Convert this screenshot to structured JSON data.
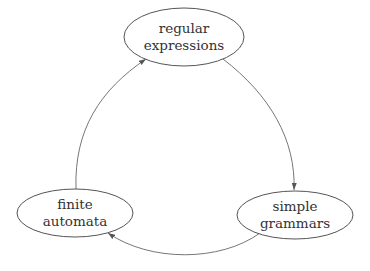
{
  "diagram": {
    "type": "cycle",
    "nodes": [
      {
        "id": "regex",
        "line1": "regular",
        "line2": "expressions",
        "cx": 184,
        "cy": 37,
        "rx": 60,
        "ry": 29
      },
      {
        "id": "grammars",
        "line1": "simple",
        "line2": "grammars",
        "cx": 295,
        "cy": 215,
        "rx": 58,
        "ry": 24
      },
      {
        "id": "automata",
        "line1": "finite",
        "line2": "automata",
        "cx": 75,
        "cy": 213,
        "rx": 58,
        "ry": 24
      }
    ],
    "edges": [
      {
        "from": "regex",
        "to": "grammars"
      },
      {
        "from": "grammars",
        "to": "automata"
      },
      {
        "from": "automata",
        "to": "regex"
      }
    ],
    "colors": {
      "stroke": "#555555",
      "text": "#333333",
      "background": "#ffffff"
    }
  }
}
